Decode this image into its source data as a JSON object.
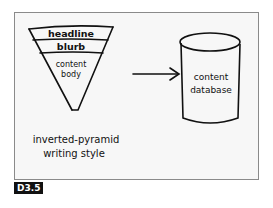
{
  "figure": {
    "label": "D3.5",
    "background_color": "#f7f7f7",
    "frame_color": "#8a8a8a",
    "ink_color": "#111111"
  },
  "diagram": {
    "pyramid": {
      "layers": [
        "headline",
        "blurb",
        "content body"
      ],
      "layer_line1": "content",
      "layer_line2": "body",
      "caption_line1": "inverted-pyramid",
      "caption_line2": "writing    style"
    },
    "arrow": {
      "direction": "right"
    },
    "database": {
      "label_line1": "content",
      "label_line2": "database"
    }
  }
}
